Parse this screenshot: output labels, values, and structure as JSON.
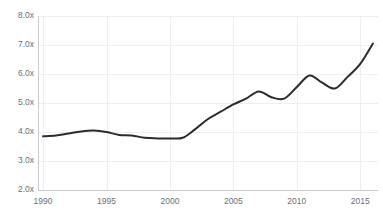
{
  "chart_data": {
    "type": "line",
    "title": "",
    "subtitle": "",
    "xlabel": "",
    "ylabel": "",
    "xlim": [
      1989.6,
      2016.4
    ],
    "ylim": [
      2.0,
      8.0
    ],
    "grid": true,
    "legend": null,
    "legend_position": "none",
    "y_ticks": [
      2.0,
      3.0,
      4.0,
      5.0,
      6.0,
      7.0,
      8.0
    ],
    "y_tick_labels": [
      "2.0x",
      "3.0x",
      "4.0x",
      "5.0x",
      "6.0x",
      "7.0x",
      "8.0x"
    ],
    "x_ticks": [
      1990,
      1995,
      2000,
      2005,
      2010,
      2015
    ],
    "x_tick_labels": [
      "1990",
      "1995",
      "2000",
      "2005",
      "2010",
      "2015"
    ],
    "series": [
      {
        "name": "ratio",
        "color": "#2b2b2b",
        "line_width": 2,
        "x": [
          1990,
          1991,
          1992,
          1993,
          1994,
          1995,
          1996,
          1997,
          1998,
          1999,
          2000,
          2001,
          2002,
          2003,
          2004,
          2005,
          2006,
          2007,
          2008,
          2009,
          2010,
          2011,
          2012,
          2013,
          2014,
          2015,
          2016
        ],
        "values": [
          3.85,
          3.88,
          3.95,
          4.02,
          4.05,
          4.0,
          3.9,
          3.88,
          3.8,
          3.78,
          3.78,
          3.8,
          4.1,
          4.45,
          4.7,
          4.95,
          5.15,
          5.4,
          5.2,
          5.15,
          5.55,
          5.95,
          5.7,
          5.5,
          5.9,
          6.35,
          7.05
        ]
      }
    ],
    "axis_color": "#c8ccd0",
    "grid_color": "#eceef0",
    "tick_label_color": "#6b7075",
    "background_color": "#ffffff"
  },
  "plot_geometry": {
    "left": 38,
    "right": 378,
    "top": 16,
    "bottom": 190
  }
}
